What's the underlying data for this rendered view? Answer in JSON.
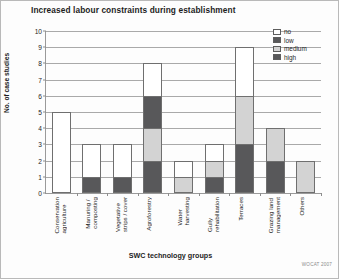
{
  "chart_data": {
    "type": "bar",
    "title": "Increased labour constraints during establishment",
    "xlabel": "SWC technology groups",
    "ylabel": "No. of case studies",
    "ylim": [
      0,
      10
    ],
    "yticks": [
      0,
      1,
      2,
      3,
      4,
      5,
      6,
      7,
      8,
      9,
      10
    ],
    "grid": true,
    "stacked": true,
    "legend_position": "top-right",
    "categories": [
      "Conservation\nagriculture",
      "Manuring /\ncomposting",
      "Vegetative\nstrips / cover",
      "Agroforestry",
      "Water\nharvesting",
      "Gully\nrehabilitation",
      "Terraces",
      "Grazing land\nmanagement",
      "Others"
    ],
    "series": [
      {
        "name": "high",
        "color": "#58585a",
        "values": [
          0,
          1,
          1,
          2,
          0,
          1,
          3,
          2,
          0
        ]
      },
      {
        "name": "medium",
        "color": "#d3d3d3",
        "values": [
          0,
          0,
          0,
          2,
          1,
          1,
          3,
          2,
          2
        ]
      },
      {
        "name": "low",
        "color": "#58585a",
        "values": [
          0,
          0,
          0,
          2,
          0,
          0,
          0,
          0,
          0
        ]
      },
      {
        "name": "no",
        "color": "#ffffff",
        "values": [
          5,
          2,
          2,
          2,
          1,
          1,
          3,
          0,
          0
        ]
      }
    ],
    "totals": [
      5,
      3,
      3,
      8,
      2,
      3,
      9,
      4,
      2
    ],
    "legend": [
      {
        "label": "no",
        "color": "#ffffff"
      },
      {
        "label": "low",
        "color": "#58585a"
      },
      {
        "label": "medium",
        "color": "#d3d3d3"
      },
      {
        "label": "high",
        "color": "#58585a"
      }
    ]
  },
  "credit": "WOCAT 2007"
}
